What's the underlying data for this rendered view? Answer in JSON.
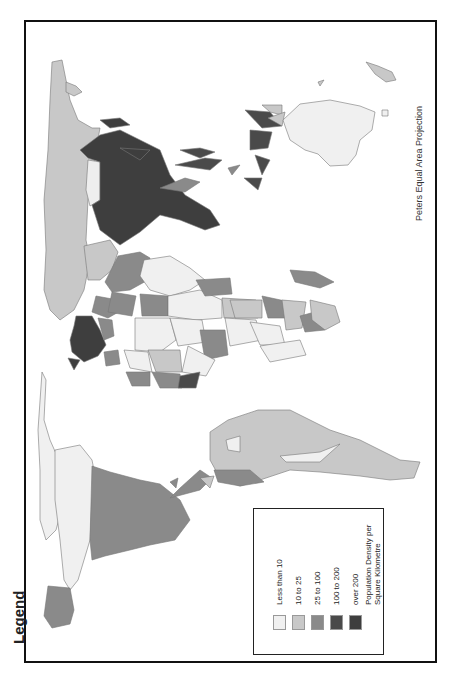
{
  "map": {
    "projection_label": "Peters Equal Area Projection",
    "orientation": "rotated 90 degrees counter-clockwise"
  },
  "legend": {
    "title": "Legend",
    "items": [
      {
        "label": "Less than 10",
        "color": "#f0f0f0"
      },
      {
        "label": "10 to 25",
        "color": "#c8c8c8"
      },
      {
        "label": "25 to 100",
        "color": "#8a8a8a"
      },
      {
        "label": "100 to 200",
        "color": "#4a4a4a"
      },
      {
        "label": "over 200",
        "color": "#3e3e3e"
      }
    ],
    "caption": "Population Density per Square Kilometre"
  },
  "colors": {
    "frame": "#111111",
    "outline": "#777777",
    "background": "#ffffff"
  }
}
